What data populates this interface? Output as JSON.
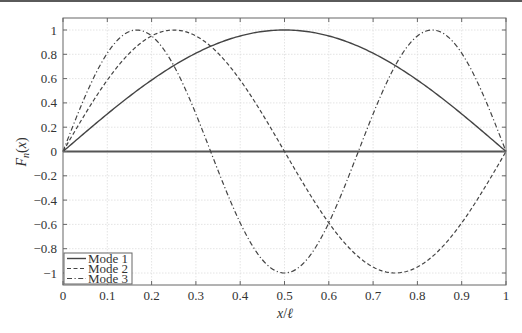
{
  "chart_data": {
    "type": "line",
    "title": "",
    "xlabel": "x/ℓ",
    "ylabel": "F_n(x)",
    "xlim": [
      0,
      1
    ],
    "ylim": [
      -1.1,
      1.1
    ],
    "grid": true,
    "legend_position": "lower left",
    "x_ticks": [
      "0",
      "0.1",
      "0.2",
      "0.3",
      "0.4",
      "0.5",
      "0.6",
      "0.7",
      "0.8",
      "0.9",
      "1"
    ],
    "y_ticks": [
      "1",
      "0.8",
      "0.6",
      "0.4",
      "0.2",
      "0",
      "-0.2",
      "-0.4",
      "-0.6",
      "-0.8",
      "-1"
    ],
    "x": [
      0,
      0.05,
      0.1,
      0.15,
      0.2,
      0.25,
      0.3,
      0.35,
      0.4,
      0.45,
      0.5,
      0.55,
      0.6,
      0.65,
      0.7,
      0.75,
      0.8,
      0.85,
      0.9,
      0.95,
      1
    ],
    "series": [
      {
        "name": "Mode 1",
        "style": "solid",
        "formula": "sin(pi x)",
        "values": [
          0,
          0.156,
          0.309,
          0.454,
          0.588,
          0.707,
          0.809,
          0.891,
          0.951,
          0.988,
          1,
          0.988,
          0.951,
          0.891,
          0.809,
          0.707,
          0.588,
          0.454,
          0.309,
          0.156,
          0
        ]
      },
      {
        "name": "Mode 2",
        "style": "dashed",
        "formula": "sin(2 pi x)",
        "values": [
          0,
          0.309,
          0.588,
          0.809,
          0.951,
          1,
          0.951,
          0.809,
          0.588,
          0.309,
          0,
          -0.309,
          -0.588,
          -0.809,
          -0.951,
          -1,
          -0.951,
          -0.809,
          -0.588,
          -0.309,
          0
        ]
      },
      {
        "name": "Mode 3",
        "style": "dash-dot",
        "formula": "sin(3 pi x)",
        "values": [
          0,
          0.454,
          0.809,
          0.988,
          0.951,
          0.707,
          0.309,
          -0.156,
          -0.588,
          -0.891,
          -1,
          -0.891,
          -0.588,
          -0.156,
          0.309,
          0.707,
          0.951,
          0.988,
          0.809,
          0.454,
          0
        ]
      }
    ],
    "reference_line": {
      "y": 0,
      "style": "solid"
    }
  },
  "legend": {
    "items": [
      {
        "label": "Mode 1"
      },
      {
        "label": "Mode 2"
      },
      {
        "label": "Mode 3"
      }
    ]
  },
  "axes": {
    "xlabel_main": "x",
    "xlabel_sep": "/",
    "xlabel_ell": "ℓ",
    "ylabel_F": "F",
    "ylabel_sub": "n",
    "ylabel_arg": "(x)"
  },
  "colors": {
    "line": "#444444",
    "frame": "#666666",
    "grid": "#dddddd",
    "topstrip": "#5a5a5a"
  }
}
